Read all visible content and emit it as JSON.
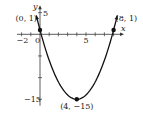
{
  "chart_data": {
    "type": "line",
    "title": "",
    "function": "y = x^2 - 8x + 1",
    "xlabel": "x",
    "ylabel": "y",
    "xlim": [
      -2.5,
      8.7
    ],
    "ylim": [
      -16.5,
      6
    ],
    "x_ticks": [
      -2,
      -1,
      0,
      1,
      2,
      3,
      4,
      5,
      6,
      7,
      8
    ],
    "x_tick_labels": [
      {
        "value": -2,
        "text": "−2"
      },
      {
        "value": 0,
        "text": "0"
      },
      {
        "value": 5,
        "text": "5"
      }
    ],
    "y_ticks": [
      5,
      -5,
      -10,
      -15
    ],
    "y_tick_labels": [
      {
        "value": 5,
        "text": "5"
      },
      {
        "value": -15,
        "text": "−15"
      }
    ],
    "grid": false,
    "series": [
      {
        "name": "parabola",
        "coefficients": {
          "a": 1,
          "b": -8,
          "c": 1
        },
        "x_range": [
          -0.4,
          8.4
        ]
      }
    ],
    "points": [
      {
        "x": 0,
        "y": 1,
        "label": "(0, 1)"
      },
      {
        "x": 8,
        "y": 1,
        "label": "(8, 1)"
      },
      {
        "x": 4,
        "y": -15,
        "label": "(4, −15)"
      }
    ]
  }
}
